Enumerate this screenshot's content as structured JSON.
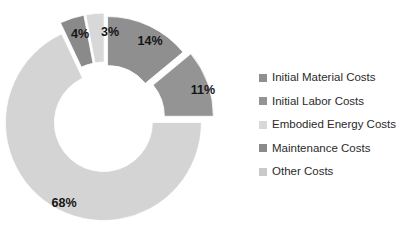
{
  "chart_data": {
    "type": "pie",
    "variant": "exploded-doughnut",
    "title": "",
    "subtitle": "",
    "xlabel": "",
    "ylabel": "",
    "grid": false,
    "legend_position": "right",
    "hole_ratio": 0.5,
    "start_angle_deg": 0,
    "direction": "clockwise",
    "exploded": true,
    "labels_unit": "%",
    "categories": [
      "Initial Material Costs",
      "Initial Labor Costs",
      "Embodied Energy Costs",
      "Maintenance Costs",
      "Other Costs"
    ],
    "values": [
      14,
      11,
      3,
      4,
      68
    ],
    "data_labels": [
      "14%",
      "11%",
      "3%",
      "4%",
      "68%"
    ],
    "colors": [
      "#8f8f8f",
      "#949494",
      "#d8d8d8",
      "#8a8a8a",
      "#d4d4d4"
    ],
    "plot_order": [
      {
        "name": "Initial Material Costs",
        "value": 14,
        "label": "14%",
        "color": "#8f8f8f"
      },
      {
        "name": "Initial Labor Costs",
        "value": 11,
        "label": "11%",
        "color": "#949494"
      },
      {
        "name": "Other Costs",
        "value": 68,
        "label": "68%",
        "color": "#d4d4d4"
      },
      {
        "name": "Maintenance Costs",
        "value": 4,
        "label": "4%",
        "color": "#8a8a8a"
      },
      {
        "name": "Embodied Energy Costs",
        "value": 3,
        "label": "3%",
        "color": "#d8d8d8"
      }
    ]
  },
  "slices": [
    {
      "id": "slice-initial-material",
      "name": "Initial Material Costs",
      "value": 14,
      "label": "14%",
      "color": "#8f8f8f",
      "start_deg": 0,
      "sweep_deg": 50.4,
      "explode": 6,
      "label_x": 150,
      "label_y": 42
    },
    {
      "id": "slice-initial-labor",
      "name": "Initial Labor Costs",
      "value": 11,
      "label": "11%",
      "color": "#949494",
      "start_deg": 50.4,
      "sweep_deg": 39.6,
      "explode": 11,
      "label_x": 203,
      "label_y": 91
    },
    {
      "id": "slice-other",
      "name": "Other Costs",
      "value": 68,
      "label": "68%",
      "color": "#d4d4d4",
      "start_deg": 90,
      "sweep_deg": 244.8,
      "explode": 3,
      "label_x": 64,
      "label_y": 204
    },
    {
      "id": "slice-maintenance",
      "name": "Maintenance Costs",
      "value": 4,
      "label": "4%",
      "color": "#8a8a8a",
      "start_deg": 334.8,
      "sweep_deg": 14.4,
      "explode": 9,
      "label_x": 80,
      "label_y": 35
    },
    {
      "id": "slice-embodied-energy",
      "name": "Embodied Energy Costs",
      "value": 3,
      "label": "3%",
      "color": "#d8d8d8",
      "start_deg": 349.2,
      "sweep_deg": 10.8,
      "explode": 9,
      "label_x": 110,
      "label_y": 33
    }
  ],
  "geometry": {
    "center_x": 105,
    "center_y": 120,
    "outer_radius": 98,
    "inner_radius": 49
  },
  "legend": {
    "items": [
      {
        "label": "Initial Material Costs",
        "color": "#8f8f8f"
      },
      {
        "label": "Initial Labor Costs",
        "color": "#949494"
      },
      {
        "label": "Embodied Energy Costs",
        "color": "#d8d8d8"
      },
      {
        "label": "Maintenance Costs",
        "color": "#8a8a8a"
      },
      {
        "label": "Other Costs",
        "color": "#c9c9c9"
      }
    ]
  }
}
